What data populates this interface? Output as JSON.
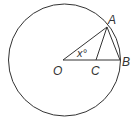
{
  "diagram": {
    "type": "geometry-circle",
    "points": {
      "O": {
        "label": "O",
        "x": 63,
        "y": 60
      },
      "A": {
        "label": "A",
        "x": 107,
        "y": 27
      },
      "B": {
        "label": "B",
        "x": 120,
        "y": 60
      },
      "C": {
        "label": "C",
        "x": 96,
        "y": 60
      }
    },
    "circle": {
      "cx": 64.5,
      "cy": 60,
      "r": 56
    },
    "angle_label": "x°",
    "segments": [
      "OA",
      "OB",
      "AC",
      "AB"
    ],
    "colors": {
      "stroke": "#333333",
      "background": "#ffffff"
    }
  }
}
